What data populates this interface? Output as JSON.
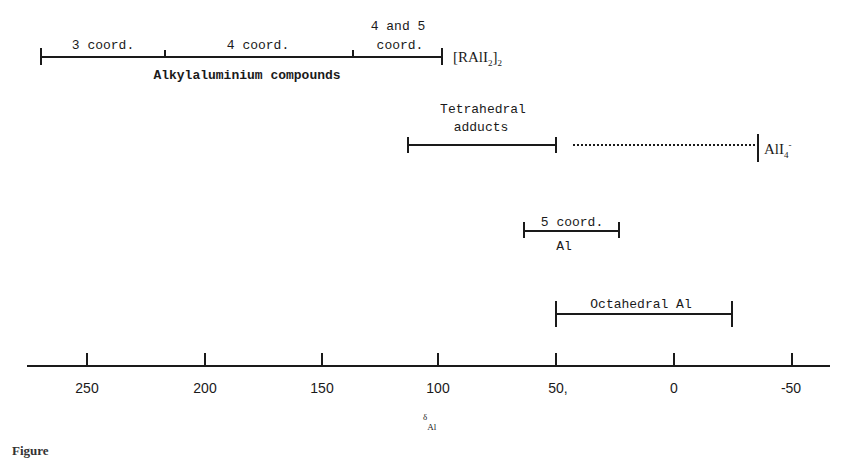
{
  "diagram": {
    "type": "chemical-shift-range-diagram",
    "axis": {
      "label_symbol": "δ",
      "label_subscript": "Al",
      "ticks": [
        "250",
        "200",
        "150",
        "100",
        "50",
        "0",
        "-50"
      ],
      "tick_values": [
        250,
        200,
        150,
        100,
        50,
        0,
        -50
      ]
    },
    "ranges": [
      {
        "group": "Alkylaluminium compounds",
        "segments": [
          {
            "label": "3 coord.",
            "from": 270,
            "to": 217
          },
          {
            "label": "4 coord.",
            "from": 217,
            "to": 137
          },
          {
            "label_line1": "4 and 5",
            "label_line2": "coord.",
            "from": 137,
            "to": 98
          }
        ],
        "end_label": {
          "main": "[RAlI",
          "sub1": "2",
          "close": "]",
          "sub2": "2",
          "value": 98
        }
      },
      {
        "label_line1": "Tetrahedral",
        "label_line2": "adducts",
        "from": 113,
        "to": 50
      },
      {
        "dotted_from": 43,
        "dotted_to": -35
      },
      {
        "end_label": {
          "main": "AlI",
          "sub": "4",
          "sup": "-",
          "value": -36
        }
      },
      {
        "label_line1": "5 coord.",
        "label_line2": "Al",
        "from": 64,
        "to": 24
      },
      {
        "label": "Octahedral Al",
        "from": 50,
        "to": -25
      }
    ],
    "caption_partial": "Figure"
  },
  "labels": {
    "alkyl_title": "Alkylaluminium compounds",
    "three_coord": "3 coord.",
    "four_coord": "4 coord.",
    "four_five_line1": "4 and 5",
    "four_five_line2": "coord.",
    "ral_main": "[RAlI",
    "ral_sub1": "2",
    "ral_close": "]",
    "ral_sub2": "2",
    "tetra_line1": "Tetrahedral",
    "tetra_line2": "adducts",
    "ali4_main": "AlI",
    "ali4_sub": "4",
    "ali4_sup": "-",
    "five_coord_line1": "5 coord.",
    "five_coord_line2": "Al",
    "octahedral": "Octahedral Al",
    "axis_symbol": "δ",
    "axis_sub": "Al",
    "tick_250": "250",
    "tick_200": "200",
    "tick_150": "150",
    "tick_100": "100",
    "tick_50": "50,",
    "tick_0": "0",
    "tick_m50": "-50"
  }
}
